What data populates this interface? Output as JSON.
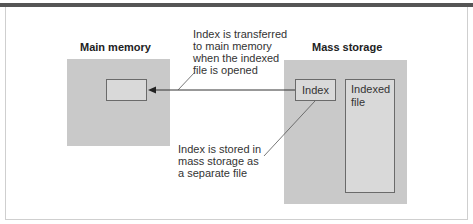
{
  "diagram": {
    "main_memory": {
      "title": "Main memory"
    },
    "mass_storage": {
      "title": "Mass storage",
      "index_label": "Index",
      "indexed_file_label_line1": "Indexed",
      "indexed_file_label_line2": "file"
    },
    "annotations": {
      "transfer_note": [
        "Index is transferred",
        "to main memory",
        "when the indexed",
        "file is opened"
      ],
      "storage_note": [
        "Index is stored in",
        "mass storage as",
        "a separate file"
      ]
    },
    "colors": {
      "panel_fill": "#c9c9c9",
      "box_fill": "#d9d9d9",
      "box_border": "#6a6a6a",
      "top_rule": "#555555"
    }
  }
}
